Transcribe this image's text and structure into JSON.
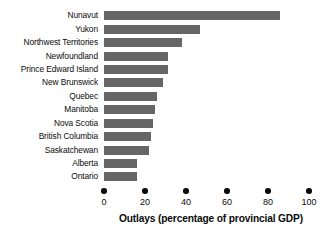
{
  "chart_data": {
    "type": "bar",
    "orientation": "horizontal",
    "title": "",
    "xlabel": "Outlays (percentage of provincial GDP)",
    "ylabel": "",
    "xlim": [
      0,
      100
    ],
    "xticks": [
      0,
      20,
      40,
      60,
      80,
      100
    ],
    "xtick_labels": [
      "0",
      "20",
      "40",
      "60",
      "80",
      "100"
    ],
    "grid": false,
    "legend": null,
    "bar_color": "#666666",
    "text_color": "#0b0b0b",
    "categories": [
      "Nunavut",
      "Yukon",
      "Northwest Territories",
      "Newfoundland",
      "Prince Edward Island",
      "New Brunswick",
      "Quebec",
      "Manitoba",
      "Nova Scotia",
      "British Columbia",
      "Saskatchewan",
      "Alberta",
      "Ontario"
    ],
    "values": [
      86,
      47,
      38,
      31,
      31,
      29,
      26,
      25,
      24,
      23,
      22,
      16,
      16
    ]
  }
}
